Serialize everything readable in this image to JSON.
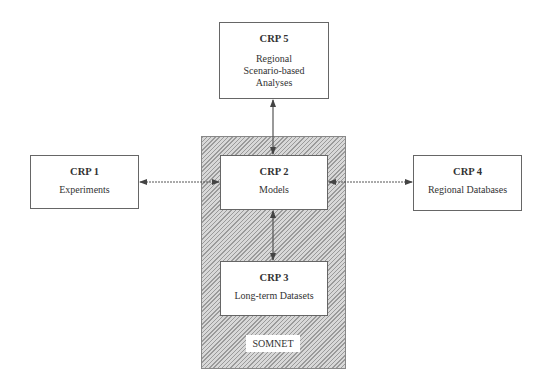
{
  "diagram": {
    "nodes": [
      {
        "id": "crp5",
        "title": "CRP 5",
        "lines": [
          "Regional",
          "Scenario-based",
          "Analyses"
        ]
      },
      {
        "id": "crp1",
        "title": "CRP 1",
        "lines": [
          "Experiments"
        ]
      },
      {
        "id": "crp2",
        "title": "CRP 2",
        "lines": [
          "Models"
        ]
      },
      {
        "id": "crp4",
        "title": "CRP 4",
        "lines": [
          "Regional Databases"
        ]
      },
      {
        "id": "crp3",
        "title": "CRP 3",
        "lines": [
          "Long-term Datasets"
        ]
      }
    ],
    "group": {
      "label": "SOMNET",
      "contains": [
        "crp2",
        "crp3"
      ]
    },
    "edges": [
      {
        "from": "crp5",
        "to": "crp2",
        "type": "bidirectional"
      },
      {
        "from": "crp1",
        "to": "crp2",
        "type": "bidirectional"
      },
      {
        "from": "crp4",
        "to": "crp2",
        "type": "bidirectional"
      },
      {
        "from": "crp2",
        "to": "crp3",
        "type": "bidirectional"
      }
    ]
  }
}
